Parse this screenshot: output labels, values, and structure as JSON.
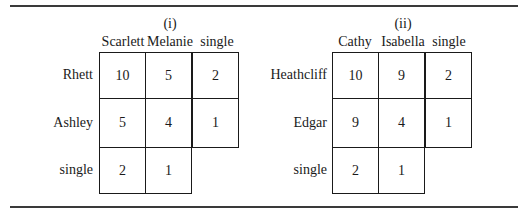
{
  "tables": [
    {
      "label": "(i)",
      "columns": [
        "Scarlett",
        "Melanie",
        "single"
      ],
      "rows": [
        {
          "label": "Rhett",
          "values": [
            "10",
            "5",
            "2"
          ]
        },
        {
          "label": "Ashley",
          "values": [
            "5",
            "4",
            "1"
          ]
        },
        {
          "label": "single",
          "values": [
            "2",
            "1"
          ]
        }
      ]
    },
    {
      "label": "(ii)",
      "columns": [
        "Cathy",
        "Isabella",
        "single"
      ],
      "rows": [
        {
          "label": "Heathcliff",
          "values": [
            "10",
            "9",
            "2"
          ]
        },
        {
          "label": "Edgar",
          "values": [
            "9",
            "4",
            "1"
          ]
        },
        {
          "label": "single",
          "values": [
            "2",
            "1"
          ]
        }
      ]
    }
  ]
}
